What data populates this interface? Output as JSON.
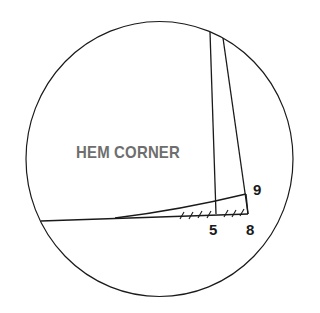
{
  "diagram": {
    "title_label": "HEM CORNER",
    "points": [
      {
        "id": "5",
        "label": "5"
      },
      {
        "id": "8",
        "label": "8"
      },
      {
        "id": "9",
        "label": "9"
      }
    ],
    "colors": {
      "line": "#1a1a1a",
      "title_text": "#6e6e6e",
      "point_text": "#1a1a1a",
      "background": "#ffffff"
    }
  }
}
